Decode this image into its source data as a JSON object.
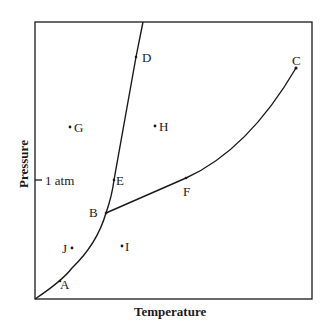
{
  "diagram": {
    "type": "phase-diagram",
    "x_axis_label": "Temperature",
    "y_axis_label": "Pressure",
    "reference_tick": "1 atm",
    "points": {
      "A": "A",
      "B": "B",
      "C": "C",
      "D": "D",
      "E": "E",
      "F": "F",
      "G": "G",
      "H": "H",
      "I": "I",
      "J": "J"
    },
    "colors": {
      "line": "#1a1a1a",
      "background": "#ffffff"
    }
  }
}
